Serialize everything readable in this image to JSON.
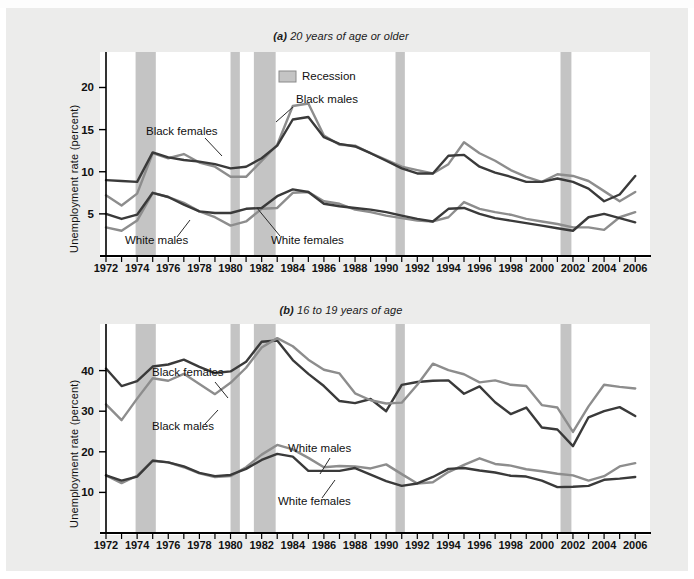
{
  "figure": {
    "legend_label": "Recession",
    "y_axis_title": "Unemployment rate (percent)"
  },
  "colors": {
    "dark_series": "#3a3a3a",
    "light_series": "#8d8d8d",
    "recession_band": "#c4c4c4",
    "plot_background": "#ffffff",
    "figure_background": "#ececeb",
    "axis": "#000000"
  },
  "panels": [
    {
      "id": "panel-a",
      "label": "(a)",
      "title": "20 years of age or older",
      "title_full": "(a) 20 years of age or older",
      "series_labels": [
        {
          "name": "black-females-label",
          "text": "Black females"
        },
        {
          "name": "black-males-label",
          "text": "Black males"
        },
        {
          "name": "white-males-label",
          "text": "White males"
        },
        {
          "name": "white-females-label",
          "text": "White females"
        }
      ]
    },
    {
      "id": "panel-b",
      "label": "(b)",
      "title": "16 to 19 years of age",
      "title_full": "(b) 16 to 19 years of age",
      "series_labels": [
        {
          "name": "black-females-label",
          "text": "Black females"
        },
        {
          "name": "black-males-label",
          "text": "Black males"
        },
        {
          "name": "white-males-label",
          "text": "White males"
        },
        {
          "name": "white-females-label",
          "text": "White females"
        }
      ]
    }
  ],
  "chart_data": [
    {
      "type": "line",
      "id": "panel-a",
      "title": "(a) 20 years of age or older",
      "xlabel": "",
      "ylabel": "Unemployment rate (percent)",
      "xlim": [
        1972,
        2006.5
      ],
      "ylim": [
        0,
        23.5
      ],
      "yticks": [
        5,
        10,
        15,
        20
      ],
      "ytick_labels": [
        "5",
        "10",
        "15",
        "20"
      ],
      "xticks": [
        1972,
        1973,
        1974,
        1975,
        1976,
        1977,
        1978,
        1979,
        1980,
        1981,
        1982,
        1983,
        1984,
        1985,
        1986,
        1987,
        1988,
        1989,
        1990,
        1991,
        1992,
        1993,
        1994,
        1995,
        1996,
        1997,
        1998,
        1999,
        2000,
        2001,
        2002,
        2003,
        2004,
        2005,
        2006
      ],
      "xtick_labels_shown": [
        "1972",
        "1974",
        "1976",
        "1978",
        "1980",
        "1982",
        "1984",
        "1986",
        "1988",
        "1990",
        "1992",
        "1994",
        "1996",
        "1998",
        "2000",
        "2002",
        "2004",
        "2006"
      ],
      "grid": false,
      "legend_position": "top-center",
      "x": [
        1972,
        1973,
        1974,
        1975,
        1976,
        1977,
        1978,
        1979,
        1980,
        1981,
        1982,
        1983,
        1984,
        1985,
        1986,
        1987,
        1988,
        1989,
        1990,
        1991,
        1992,
        1993,
        1994,
        1995,
        1996,
        1997,
        1998,
        1999,
        2000,
        2001,
        2002,
        2003,
        2004,
        2005,
        2006
      ],
      "series": [
        {
          "name": "Black females",
          "color": "#8d8d8d",
          "values": [
            7.2,
            6.0,
            7.4,
            12.2,
            11.6,
            12.1,
            11.1,
            10.6,
            9.4,
            9.4,
            11.3,
            13.2,
            17.8,
            18.1,
            14.3,
            13.2,
            13.1,
            12.2,
            11.4,
            10.6,
            10.2,
            9.8,
            10.9,
            13.5,
            12.2,
            11.3,
            10.2,
            9.4,
            8.8,
            9.7,
            9.5,
            8.9,
            7.7,
            6.5,
            7.6,
            10.5,
            10.3,
            9.3,
            8.4
          ]
        },
        {
          "name": "Black males",
          "color": "#3a3a3a",
          "values": [
            9.0,
            8.9,
            8.8,
            12.3,
            11.7,
            11.4,
            11.2,
            10.9,
            10.4,
            10.6,
            11.6,
            13.1,
            16.2,
            16.5,
            14.1,
            13.3,
            13.0,
            12.2,
            11.3,
            10.4,
            9.8,
            9.8,
            11.9,
            12.0,
            10.6,
            9.9,
            9.4,
            8.8,
            8.8,
            9.2,
            8.8,
            8.0,
            6.5,
            7.3,
            9.5,
            9.4,
            8.6,
            7.1
          ]
        },
        {
          "name": "White females",
          "color": "#8d8d8d",
          "values": [
            3.4,
            3.0,
            4.2,
            7.5,
            7.0,
            6.3,
            5.3,
            4.6,
            3.6,
            4.1,
            5.6,
            5.7,
            7.5,
            7.6,
            6.5,
            6.2,
            5.5,
            5.2,
            4.8,
            4.5,
            4.2,
            4.1,
            4.6,
            6.4,
            5.6,
            5.2,
            4.9,
            4.4,
            4.1,
            3.8,
            3.4,
            3.4,
            3.1,
            4.6,
            5.2,
            4.8,
            4.2,
            3.4
          ]
        },
        {
          "name": "White males",
          "color": "#3a3a3a",
          "values": [
            5.0,
            4.4,
            4.9,
            7.5,
            7.0,
            6.1,
            5.3,
            5.1,
            5.1,
            5.6,
            5.7,
            7.1,
            7.9,
            7.6,
            6.2,
            5.9,
            5.7,
            5.5,
            5.2,
            4.8,
            4.4,
            4.1,
            5.6,
            5.7,
            5.0,
            4.5,
            4.2,
            3.9,
            3.6,
            3.3,
            3.0,
            4.6,
            5.0,
            4.5,
            4.0,
            3.3
          ]
        }
      ],
      "recessions": [
        {
          "start": 1973.9,
          "end": 1975.2
        },
        {
          "start": 1980.0,
          "end": 1980.6
        },
        {
          "start": 1981.5,
          "end": 1982.9
        },
        {
          "start": 1990.6,
          "end": 1991.2
        },
        {
          "start": 2001.2,
          "end": 2001.9
        }
      ]
    },
    {
      "type": "line",
      "id": "panel-b",
      "title": "(b) 16 to 19 years of age",
      "xlabel": "",
      "ylabel": "Unemployment rate (percent)",
      "xlim": [
        1972,
        2006.5
      ],
      "ylim": [
        0,
        50
      ],
      "yticks": [
        10,
        20,
        30,
        40
      ],
      "ytick_labels": [
        "10",
        "20",
        "30",
        "40"
      ],
      "xticks": [
        1972,
        1973,
        1974,
        1975,
        1976,
        1977,
        1978,
        1979,
        1980,
        1981,
        1982,
        1983,
        1984,
        1985,
        1986,
        1987,
        1988,
        1989,
        1990,
        1991,
        1992,
        1993,
        1994,
        1995,
        1996,
        1997,
        1998,
        1999,
        2000,
        2001,
        2002,
        2003,
        2004,
        2005,
        2006
      ],
      "xtick_labels_shown": [
        "1972",
        "1974",
        "1976",
        "1978",
        "1980",
        "1982",
        "1984",
        "1986",
        "1988",
        "1990",
        "1992",
        "1994",
        "1996",
        "1998",
        "2000",
        "2002",
        "2004",
        "2006"
      ],
      "grid": false,
      "legend_position": "none",
      "x": [
        1972,
        1973,
        1974,
        1975,
        1976,
        1977,
        1978,
        1979,
        1980,
        1981,
        1982,
        1983,
        1984,
        1985,
        1986,
        1987,
        1988,
        1989,
        1990,
        1991,
        1992,
        1993,
        1994,
        1995,
        1996,
        1997,
        1998,
        1999,
        2000,
        2001,
        2002,
        2003,
        2004,
        2005,
        2006
      ],
      "series": [
        {
          "name": "Black females",
          "color": "#3a3a3a",
          "values": [
            40.5,
            36.2,
            37.4,
            41.0,
            41.5,
            42.7,
            40.9,
            39.4,
            39.8,
            42.2,
            47.1,
            47.4,
            42.6,
            39.2,
            36.2,
            32.5,
            32.0,
            33.0,
            30.0,
            36.5,
            37.2,
            37.5,
            37.6,
            34.3,
            36.1,
            32.2,
            29.3,
            30.9,
            26.0,
            25.5,
            21.4,
            28.5,
            30.0,
            31.0,
            28.8,
            30.9,
            26.0
          ]
        },
        {
          "name": "Black males",
          "color": "#8d8d8d",
          "values": [
            31.7,
            27.8,
            33.1,
            38.1,
            37.5,
            39.2,
            36.7,
            34.2,
            37.0,
            40.7,
            45.7,
            48.0,
            46.0,
            42.7,
            40.2,
            39.3,
            34.4,
            32.7,
            31.9,
            32.1,
            36.5,
            41.7,
            40.1,
            39.1,
            37.1,
            37.6,
            36.5,
            36.2,
            31.5,
            30.9,
            24.9,
            31.2,
            36.5,
            36.0,
            35.6,
            37.0,
            32.8
          ]
        },
        {
          "name": "White males",
          "color": "#8d8d8d",
          "values": [
            14.2,
            12.3,
            14.1,
            17.9,
            17.4,
            16.2,
            14.7,
            13.8,
            14.0,
            16.2,
            19.3,
            21.7,
            20.6,
            18.5,
            16.2,
            16.5,
            16.4,
            15.9,
            16.9,
            14.5,
            12.2,
            12.5,
            15.0,
            16.8,
            18.4,
            17.0,
            16.6,
            15.7,
            15.2,
            14.6,
            14.2,
            12.9,
            14.0,
            16.4,
            17.2,
            16.8,
            16.3,
            15.0
          ]
        },
        {
          "name": "White females",
          "color": "#3a3a3a",
          "values": [
            14.2,
            12.9,
            13.9,
            17.8,
            17.4,
            16.4,
            14.8,
            14.0,
            14.3,
            15.8,
            18.0,
            19.5,
            18.8,
            15.3,
            15.3,
            15.3,
            16.0,
            14.4,
            12.8,
            11.6,
            12.2,
            13.8,
            15.8,
            16.0,
            15.4,
            14.9,
            14.1,
            13.9,
            12.9,
            11.3,
            11.4,
            11.6,
            13.1,
            13.4,
            13.8,
            14.1,
            12.3
          ]
        }
      ],
      "recessions": [
        {
          "start": 1973.9,
          "end": 1975.2
        },
        {
          "start": 1980.0,
          "end": 1980.6
        },
        {
          "start": 1981.5,
          "end": 1982.9
        },
        {
          "start": 1990.6,
          "end": 1991.2
        },
        {
          "start": 2001.2,
          "end": 2001.9
        }
      ]
    }
  ]
}
